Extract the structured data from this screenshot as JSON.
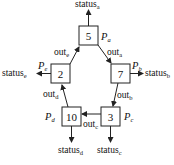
{
  "diagram": {
    "nodes": [
      {
        "id": "a",
        "value": "5",
        "process": "P",
        "process_sub": "a",
        "status": "status",
        "status_sub": "a"
      },
      {
        "id": "b",
        "value": "7",
        "process": "P",
        "process_sub": "b",
        "status": "status",
        "status_sub": "b"
      },
      {
        "id": "c",
        "value": "3",
        "process": "P",
        "process_sub": "c",
        "status": "status",
        "status_sub": "c"
      },
      {
        "id": "d",
        "value": "10",
        "process": "P",
        "process_sub": "d",
        "status": "status",
        "status_sub": "d"
      },
      {
        "id": "e",
        "value": "2",
        "process": "P",
        "process_sub": "e",
        "status": "status",
        "status_sub": "e"
      }
    ],
    "edges": [
      {
        "from": "a",
        "to": "b",
        "label": "out",
        "label_sub": "a"
      },
      {
        "from": "b",
        "to": "c",
        "label": "out",
        "label_sub": "b"
      },
      {
        "from": "c",
        "to": "d",
        "label": "out",
        "label_sub": "c"
      },
      {
        "from": "d",
        "to": "e",
        "label": "out",
        "label_sub": "d"
      },
      {
        "from": "e",
        "to": "a",
        "label": "out",
        "label_sub": "e"
      }
    ]
  }
}
